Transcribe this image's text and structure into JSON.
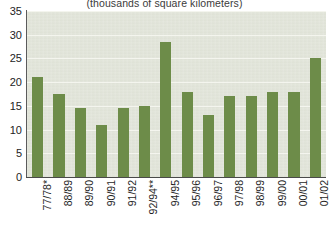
{
  "chart_data": {
    "type": "bar",
    "title": "(thousands of square kilometers)",
    "xlabel": "",
    "ylabel": "",
    "ylim": [
      0,
      35
    ],
    "yticks": [
      0,
      5,
      10,
      15,
      20,
      25,
      30,
      35
    ],
    "grid": true,
    "legend": "none",
    "bar_color": "#6d8c49",
    "plot_background": "#e2e5da",
    "categories": [
      "77/78*",
      "88/89",
      "89/90",
      "90/91",
      "91/92",
      "92/94**",
      "94/95",
      "95/96",
      "96/97",
      "97/98",
      "98/99",
      "99/00",
      "00/01",
      "01/02"
    ],
    "values": [
      21,
      17.5,
      14.5,
      11,
      14.5,
      15,
      28.5,
      18,
      13,
      17,
      17,
      18,
      18,
      25
    ],
    "notes": [
      "*",
      "**"
    ]
  },
  "axes": {
    "y_tick_labels": [
      "35",
      "30",
      "25",
      "20",
      "15",
      "10",
      "5",
      "0"
    ]
  }
}
